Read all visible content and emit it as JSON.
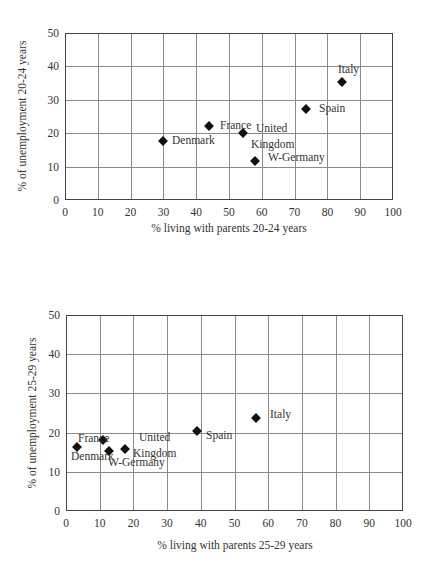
{
  "chart_data": [
    {
      "type": "scatter",
      "title": "",
      "xlabel": "% living with parents 20-24 years",
      "ylabel": "% of unemployment 20-24 years",
      "xlim": [
        0,
        100
      ],
      "ylim": [
        0,
        50
      ],
      "xticks": [
        "0",
        "10",
        "20",
        "30",
        "40",
        "50",
        "60",
        "70",
        "80",
        "90",
        "100"
      ],
      "yticks": [
        "0",
        "10",
        "20",
        "30",
        "40",
        "50"
      ],
      "grid": true,
      "legend": null,
      "points": [
        {
          "label": "Denmark",
          "x": 30,
          "y": 17.5
        },
        {
          "label": "France",
          "x": 44,
          "y": 22
        },
        {
          "label": "United Kingdom",
          "x": 54,
          "y": 20
        },
        {
          "label": "W-Germany",
          "x": 58,
          "y": 11.5
        },
        {
          "label": "Spain",
          "x": 73,
          "y": 27
        },
        {
          "label": "Italy",
          "x": 84,
          "y": 35
        }
      ]
    },
    {
      "type": "scatter",
      "title": "",
      "xlabel": "% living with parents 25-29 years",
      "ylabel": "% of unemployment 25-29 years",
      "xlim": [
        0,
        100
      ],
      "ylim": [
        0,
        50
      ],
      "xticks": [
        "0",
        "10",
        "20",
        "30",
        "40",
        "50",
        "60",
        "70",
        "80",
        "90",
        "100"
      ],
      "yticks": [
        "0",
        "10",
        "20",
        "30",
        "40",
        "50"
      ],
      "grid": true,
      "legend": null,
      "points": [
        {
          "label": "Denmark",
          "x": 3.5,
          "y": 16
        },
        {
          "label": "France",
          "x": 11,
          "y": 18
        },
        {
          "label": "W-Germany",
          "x": 12.5,
          "y": 15
        },
        {
          "label": "United Kingdom",
          "x": 17.5,
          "y": 15.5
        },
        {
          "label": "Spain",
          "x": 39,
          "y": 20
        },
        {
          "label": "Italy",
          "x": 56.5,
          "y": 23.5
        }
      ]
    }
  ],
  "charts": [
    {
      "xlabel": "% living with parents 20-24 years",
      "ylabel": "% of unemployment 20-24 years",
      "labels": {
        "denmark": "Denmark",
        "france": "France",
        "uk_line1": "United",
        "uk_line2": "Kingdom",
        "wgermany": "W-Germany",
        "spain": "Spain",
        "italy": "Italy"
      }
    },
    {
      "xlabel": "% living with parents 25-29 years",
      "ylabel": "% of unemployment 25-29 years",
      "labels": {
        "denmark": "Denmark",
        "france": "France",
        "uk_line1": "United",
        "uk_line2": "Kingdom",
        "wgermany": "W-Germany",
        "spain": "Spain",
        "italy": "Italy"
      }
    }
  ],
  "ticks": {
    "x": [
      "0",
      "10",
      "20",
      "30",
      "40",
      "50",
      "60",
      "70",
      "80",
      "90",
      "100"
    ],
    "y": [
      "0",
      "10",
      "20",
      "30",
      "40",
      "50"
    ]
  }
}
